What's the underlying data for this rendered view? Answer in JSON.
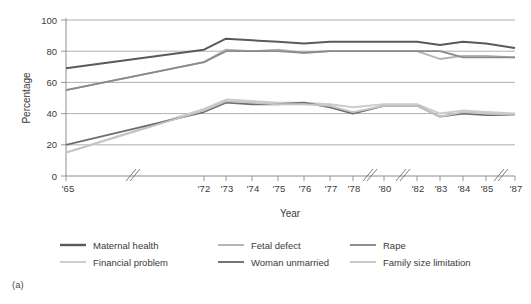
{
  "figure": {
    "panel_label": "(a)"
  },
  "chart_data": {
    "type": "line",
    "title": "",
    "xlabel": "Year",
    "ylabel": "Percentage",
    "ylim": [
      0,
      100
    ],
    "yticks": [
      0,
      20,
      40,
      60,
      80,
      100
    ],
    "ytick_labels": [
      "0",
      "20",
      "40",
      "60",
      "80",
      "100"
    ],
    "grid": true,
    "legend_position": "below",
    "axis_breaks": [
      "between '65 and '72",
      "between '78 and '80",
      "between '80 and '82",
      "between '85 and '87"
    ],
    "categories": [
      "'65",
      "'72",
      "'73",
      "'74",
      "'75",
      "'76",
      "'77",
      "'78",
      "'80",
      "'82",
      "'83",
      "'84",
      "'85",
      "'87"
    ],
    "series": [
      {
        "name": "Maternal health",
        "color": "#5a5a5a",
        "width": 2.0,
        "values": [
          69,
          81,
          88,
          87,
          86,
          85,
          86,
          86,
          86,
          86,
          84,
          86,
          85,
          82
        ]
      },
      {
        "name": "Fetal defect",
        "color": "#b2b2b2",
        "width": 1.8,
        "values": [
          55,
          73,
          81,
          80,
          81,
          79,
          80,
          80,
          80,
          80,
          75,
          77,
          77,
          76
        ]
      },
      {
        "name": "Rape",
        "color": "#8a8a8a",
        "width": 1.8,
        "values": [
          55,
          73,
          80,
          80,
          80,
          79,
          80,
          80,
          80,
          80,
          80,
          76,
          76,
          76
        ]
      },
      {
        "name": "Financial problem",
        "color": "#cccccc",
        "width": 2.0,
        "values": [
          15,
          43,
          49,
          48,
          47,
          47,
          46,
          44,
          46,
          46,
          40,
          42,
          41,
          40
        ]
      },
      {
        "name": "Woman unmarried",
        "color": "#6e6e6e",
        "width": 1.8,
        "values": [
          20,
          41,
          47,
          46,
          46,
          47,
          44,
          40,
          45,
          45,
          38,
          40,
          39,
          39
        ]
      },
      {
        "name": "Family size limitation",
        "color": "#c4c4c4",
        "width": 1.8,
        "values": [
          15,
          42,
          48,
          47,
          46,
          46,
          45,
          41,
          45,
          45,
          38,
          41,
          40,
          39
        ]
      }
    ],
    "legend": [
      {
        "label": "Maternal health",
        "color": "#5a5a5a"
      },
      {
        "label": "Fetal defect",
        "color": "#b2b2b2"
      },
      {
        "label": "Rape",
        "color": "#8a8a8a"
      },
      {
        "label": "Financial problem",
        "color": "#cccccc"
      },
      {
        "label": "Woman unmarried",
        "color": "#6e6e6e"
      },
      {
        "label": "Family size limitation",
        "color": "#c4c4c4"
      }
    ]
  }
}
